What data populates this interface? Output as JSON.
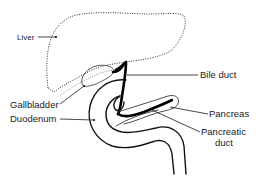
{
  "diagram": {
    "title": "",
    "labels": {
      "liver": "Liver",
      "bile_duct": "Bile duct",
      "gallbladder": "Gallbladder",
      "duodenum": "Duodenum",
      "pancreas": "Pancreas",
      "pancreatic_duct_line1": "Pancreatic",
      "pancreatic_duct_line2": "duct"
    },
    "colors": {
      "ink": "#1a1a1a",
      "background": "#ffffff"
    }
  }
}
